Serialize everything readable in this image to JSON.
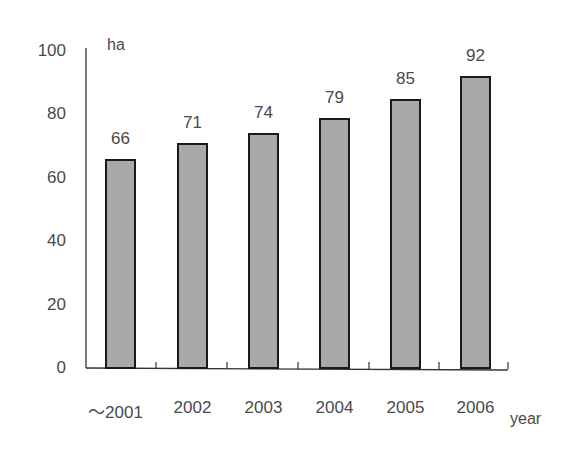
{
  "chart_data": {
    "type": "bar",
    "title": "",
    "xlabel": "year",
    "ylabel": "ha",
    "categories": [
      "～2001",
      "2002",
      "2003",
      "2004",
      "2005",
      "2006"
    ],
    "values": [
      66,
      71,
      74,
      79,
      85,
      92
    ],
    "ylim": [
      0,
      100
    ],
    "yticks": [
      0,
      20,
      40,
      60,
      80,
      100
    ],
    "grid": false,
    "legend": null,
    "bar_color": "#a9a9a9",
    "bar_edge_color": "#1a1a1a"
  }
}
